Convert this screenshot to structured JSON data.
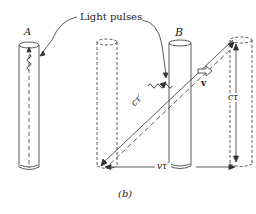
{
  "diagram": {
    "caption": "(b)",
    "callout": "Light pulses",
    "clock_a_label": "A",
    "clock_b_label": "B",
    "hyp_label": "cτ′",
    "vert_label": "cτ",
    "base_label": "vτ′",
    "velocity_label": "v",
    "colors": {
      "stroke": "#333333",
      "fill": "#ffffff"
    }
  }
}
